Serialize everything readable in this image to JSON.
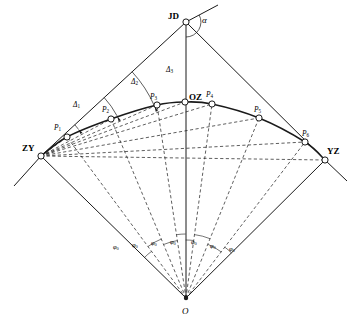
{
  "figure": {
    "type": "geometry-diagram",
    "background_color": "#ffffff",
    "line_color": "#1a1a1a",
    "marker_fill": "#ffffff"
  },
  "points": [
    {
      "id": "JD",
      "label": "JD",
      "x": 186,
      "y": 22,
      "label_x": 168,
      "label_y": 12,
      "kind": "vertex"
    },
    {
      "id": "ZY",
      "label": "ZY",
      "x": 41,
      "y": 156,
      "label_x": 22,
      "label_y": 144,
      "kind": "tangent-start"
    },
    {
      "id": "P1",
      "label": "P",
      "sub": "1",
      "x": 67,
      "y": 137,
      "label_x": 54,
      "label_y": 124,
      "kind": "detail"
    },
    {
      "id": "P2",
      "label": "P",
      "sub": "2",
      "x": 111,
      "y": 119,
      "label_x": 102,
      "label_y": 106,
      "kind": "detail"
    },
    {
      "id": "P3",
      "label": "P",
      "sub": "3",
      "x": 157,
      "y": 105,
      "label_x": 150,
      "label_y": 93,
      "kind": "detail"
    },
    {
      "id": "OZ",
      "label": "OZ",
      "x": 185,
      "y": 102,
      "label_x": 189,
      "label_y": 93,
      "kind": "curve-midpoint"
    },
    {
      "id": "P4",
      "label": "P",
      "sub": "4",
      "x": 212,
      "y": 104,
      "label_x": 206,
      "label_y": 91,
      "kind": "detail"
    },
    {
      "id": "P5",
      "label": "P",
      "sub": "5",
      "x": 259,
      "y": 118,
      "label_x": 254,
      "label_y": 106,
      "kind": "detail"
    },
    {
      "id": "P6",
      "label": "P",
      "sub": "6",
      "x": 305,
      "y": 142,
      "label_x": 302,
      "label_y": 130,
      "kind": "detail"
    },
    {
      "id": "YZ",
      "label": "YZ",
      "x": 325,
      "y": 160,
      "label_x": 327,
      "label_y": 147,
      "kind": "tangent-end"
    },
    {
      "id": "O",
      "label": "O",
      "x": 186,
      "y": 298,
      "label_x": 182,
      "label_y": 307,
      "kind": "curve-center"
    }
  ],
  "angle_labels": {
    "alpha": {
      "text": "α",
      "x": 202,
      "y": 16,
      "desc": "intersection angle at JD"
    },
    "deltas": [
      {
        "text": "Δ",
        "sub": "1",
        "x": 73,
        "y": 101,
        "desc": "deflection angle to P1"
      },
      {
        "text": "Δ",
        "sub": "2",
        "x": 131,
        "y": 78,
        "desc": "deflection angle to P2"
      },
      {
        "text": "Δ",
        "sub": "3",
        "x": 166,
        "y": 66,
        "desc": "deflection angle to P3"
      }
    ],
    "phis": [
      {
        "text": "φ",
        "sub": "0",
        "x": 113,
        "y": 244
      },
      {
        "text": "φ",
        "sub": "0",
        "x": 132,
        "y": 242
      },
      {
        "text": "φ",
        "sub": "0",
        "x": 151,
        "y": 240
      },
      {
        "text": "φ",
        "sub": "0",
        "x": 170,
        "y": 239
      },
      {
        "text": "φ",
        "sub": "0",
        "x": 191,
        "y": 239
      },
      {
        "text": "φ",
        "sub": "0",
        "x": 210,
        "y": 243
      },
      {
        "text": "φ",
        "sub": "0",
        "x": 229,
        "y": 246
      }
    ]
  },
  "geometry": {
    "tangent_back_extension": {
      "x": 14,
      "y": 186
    },
    "tangent_fwd_extension": {
      "x": 347,
      "y": 181
    },
    "alpha_ray_extension": {
      "x": 218,
      "y": 5
    },
    "center_axis": {
      "from": {
        "x": 186,
        "y": 22
      },
      "to": {
        "x": 186,
        "y": 298
      }
    },
    "radius_approx": 200,
    "sector_count": 7
  }
}
